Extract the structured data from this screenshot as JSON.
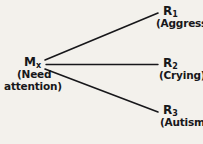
{
  "diagram": {
    "background_color": "#f3f1ec",
    "line_color": "#17171a",
    "text_color": "#17171a",
    "source": {
      "code": "M",
      "subscript": "x",
      "description_line1": "(Need",
      "description_line2": "attention)"
    },
    "responses": [
      {
        "code": "R",
        "subscript": "1",
        "description": "(Aggression)"
      },
      {
        "code": "R",
        "subscript": "2",
        "description": "(Crying)"
      },
      {
        "code": "R",
        "subscript": "3",
        "description": "(Autism)"
      }
    ],
    "edges": [
      {
        "name": "edge-to-r1",
        "x1": 45,
        "y1": 60,
        "x2": 158,
        "y2": 13
      },
      {
        "name": "edge-to-r2",
        "x1": 46,
        "y1": 64.5,
        "x2": 158,
        "y2": 64.5
      },
      {
        "name": "edge-to-r3",
        "x1": 45,
        "y1": 69,
        "x2": 158,
        "y2": 112
      }
    ]
  }
}
